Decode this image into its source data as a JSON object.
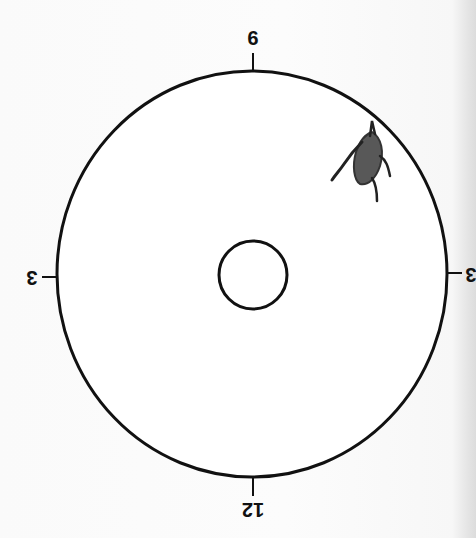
{
  "diagram": {
    "orientation": "rotated-180",
    "colors": {
      "background": "#fbfbfb",
      "stroke": "#111111",
      "lesion_fill": "#4a4a4a",
      "edge_shadow": "#dcdcdc"
    },
    "outer_circle": {
      "cx": 252,
      "cy": 274,
      "rx": 195,
      "ry": 203
    },
    "inner_circle": {
      "cx": 253,
      "cy": 275,
      "r": 34
    },
    "clock_labels": {
      "top": "9",
      "left": "3",
      "right": "3",
      "bottom": "12"
    },
    "lesion": {
      "label": "lesion-drawing",
      "approx_position": "upper-right quadrant, near circle edge"
    }
  }
}
